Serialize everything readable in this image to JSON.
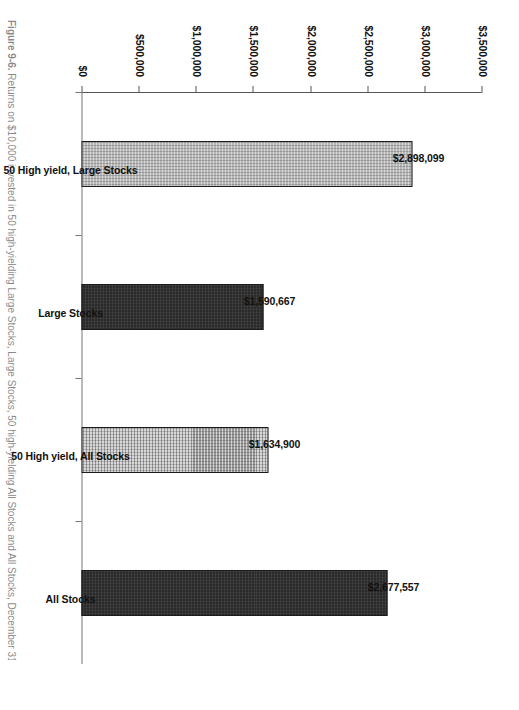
{
  "chart_data": {
    "type": "bar",
    "title": "",
    "xlabel": "",
    "ylabel": "",
    "categories": [
      "50 High yield, Large Stocks",
      "Large Stocks",
      "50 High yield, All Stocks",
      "All Stocks"
    ],
    "values": [
      2898099,
      1590667,
      1634900,
      2677557
    ],
    "value_labels": [
      "$2,898,099",
      "$1,590,667",
      "$1,634,900",
      "$2,677,557"
    ],
    "ylim": [
      0,
      3500000
    ],
    "ytick_values": [
      0,
      500000,
      1000000,
      1500000,
      2000000,
      2500000,
      3000000,
      3500000
    ],
    "ytick_labels": [
      "$0",
      "$500,000",
      "$1,000,000",
      "$1,500,000",
      "$2,000,000",
      "$2,500,000",
      "$3,000,000",
      "$3,500,000"
    ],
    "grid": false,
    "legend": false,
    "series": [
      {
        "name": "Terminal value",
        "values": [
          2898099,
          1590667,
          1634900,
          2677557
        ],
        "fills": [
          "light-hatch",
          "dark-solid",
          "light-hatch",
          "dark-solid"
        ]
      }
    ]
  },
  "caption": {
    "label": "Figure 9-6.",
    "text": "Returns on $10,000 invested in 50 high-yielding Large Stocks, Large Stocks, 50 high-yielding All Stocks and All Stocks, December 31, 1951 to December 31, 1996."
  },
  "colors": {
    "bar_light": "#d8d8d8",
    "bar_dark": "#2a2a2a",
    "bar_outline": "#1b1b1b",
    "axis": "#555555",
    "text": "#111111",
    "background": "#ffffff"
  }
}
